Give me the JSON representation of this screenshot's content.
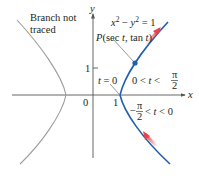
{
  "figure": {
    "type": "hyperbola-parametric-diagram",
    "equation": "x² − y² = 1",
    "equation_parts": {
      "x": "x",
      "x_exp": "2",
      "minus": " − ",
      "y": "y",
      "y_exp": "2",
      "rhs": " = 1"
    },
    "point_label": {
      "P": "P",
      "args": "(sec ",
      "t1": "t",
      "mid": ", tan ",
      "t2": "t",
      "close": ")"
    },
    "branch_note": [
      "Branch not",
      "traced"
    ],
    "axes": {
      "x_label": "x",
      "y_label": "y",
      "origin": "0",
      "x_tick": "1",
      "y_tick": "1"
    },
    "t_zero": {
      "t": "t",
      "eq": " = 0"
    },
    "range_upper": {
      "left": "0 < ",
      "t": "t",
      "rel": " < ",
      "num": "π",
      "den": "2"
    },
    "range_lower": {
      "minus": "−",
      "num": "π",
      "den": "2",
      "rel": " < ",
      "t": "t",
      "right": " < 0"
    },
    "colors": {
      "traced_branch": "#1f5fae",
      "untraced_branch": "#9b9b9b",
      "axis": "#555555",
      "arrow": "#e8444a",
      "point": "#1f5fae",
      "text": "#231f20"
    }
  }
}
